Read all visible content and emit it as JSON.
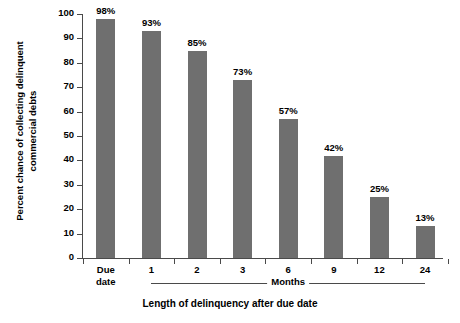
{
  "chart_data": {
    "type": "bar",
    "title": "",
    "xlabel": "Length of delinquency after due date",
    "ylabel": "Percent chance of collecting delinquent commercial debts",
    "ylabel_lines": [
      "Percent chance of collecting delinquent",
      "commercial debts"
    ],
    "categories": [
      "Due date",
      "1",
      "2",
      "3",
      "6",
      "9",
      "12",
      "24"
    ],
    "category_lines": [
      [
        "Due",
        "date"
      ],
      [
        "1"
      ],
      [
        "2"
      ],
      [
        "3"
      ],
      [
        "6"
      ],
      [
        "9"
      ],
      [
        "12"
      ],
      [
        "24"
      ]
    ],
    "values": [
      98,
      93,
      85,
      73,
      57,
      42,
      25,
      13
    ],
    "value_labels": [
      "98%",
      "93%",
      "85%",
      "73%",
      "57%",
      "42%",
      "25%",
      "13%"
    ],
    "ylim": [
      0,
      100
    ],
    "yticks": [
      0,
      10,
      20,
      30,
      40,
      50,
      60,
      70,
      80,
      90,
      100
    ],
    "ytick_labels": [
      "0",
      "10",
      "20",
      "30",
      "40",
      "50",
      "60",
      "70",
      "80",
      "90",
      "100"
    ],
    "grid": false,
    "legend": null,
    "bar_color": "#6f6f6f",
    "axis_color": "#4a4a4a",
    "text_color": "#000000",
    "background_color": "#ffffff",
    "group_brackets": [
      {
        "label": "Months",
        "from_category": "1",
        "to_category": "24"
      }
    ]
  }
}
